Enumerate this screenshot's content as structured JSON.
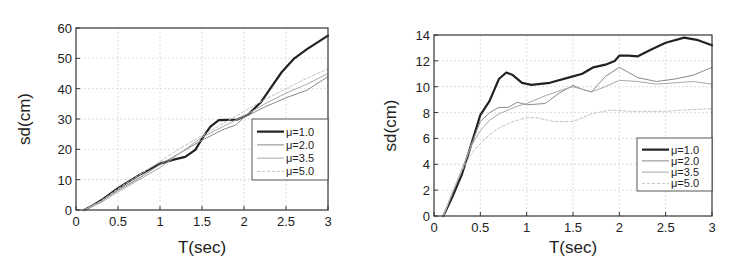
{
  "chart_data": [
    {
      "type": "line",
      "title": "",
      "xlabel": "T(sec)",
      "ylabel": "sd(cm)",
      "xlim": [
        0,
        3
      ],
      "ylim": [
        0,
        60
      ],
      "xticks": [
        0,
        0.5,
        1,
        1.5,
        2,
        2.5,
        3
      ],
      "xtick_labels": [
        "0",
        "0.5",
        "1",
        "1.5",
        "2",
        "2.5",
        "3"
      ],
      "yticks": [
        0,
        10,
        20,
        30,
        40,
        50,
        60
      ],
      "ytick_labels": [
        "0",
        "10",
        "20",
        "30",
        "40",
        "50",
        "60"
      ],
      "grid": true,
      "legend_position": "lower right (inside)",
      "series": [
        {
          "name": "μ=1.0",
          "color": "#222222",
          "width": 2.2,
          "dash": "",
          "x": [
            0.1,
            0.2,
            0.3,
            0.5,
            0.75,
            1.0,
            1.15,
            1.3,
            1.42,
            1.5,
            1.6,
            1.7,
            1.8,
            1.92,
            2.05,
            2.2,
            2.3,
            2.45,
            2.6,
            2.75,
            3.0
          ],
          "y": [
            0,
            1.5,
            3.2,
            7.2,
            11.5,
            15.3,
            16.5,
            17.5,
            19.8,
            23.5,
            27.5,
            29.6,
            29.7,
            29.8,
            31.5,
            35.5,
            39.5,
            45.5,
            50,
            53,
            57.5
          ]
        },
        {
          "name": "μ=2.0",
          "color": "#8a8a8a",
          "width": 1.0,
          "dash": "",
          "x": [
            0.1,
            0.3,
            0.5,
            0.75,
            1.0,
            1.25,
            1.5,
            1.75,
            1.9,
            2.0,
            2.25,
            2.5,
            2.75,
            3.0
          ],
          "y": [
            0,
            3,
            6.5,
            10.5,
            15,
            19,
            23,
            26.5,
            28,
            30.5,
            34,
            37,
            39.5,
            44
          ]
        },
        {
          "name": "μ=3.5",
          "color": "#a8a8a8",
          "width": 1.0,
          "dash": "",
          "x": [
            0.1,
            0.3,
            0.5,
            0.75,
            1.0,
            1.25,
            1.5,
            1.75,
            2.0,
            2.25,
            2.5,
            2.75,
            3.0
          ],
          "y": [
            0,
            2.5,
            6,
            10,
            14,
            19,
            24,
            27.5,
            31,
            35,
            38.5,
            41.5,
            45
          ]
        },
        {
          "name": "μ=5.0",
          "color": "#c4c4c4",
          "width": 1.0,
          "dash": "3,2",
          "x": [
            0.1,
            0.3,
            0.5,
            0.75,
            1.0,
            1.25,
            1.5,
            1.75,
            2.0,
            2.25,
            2.5,
            2.75,
            3.0
          ],
          "y": [
            0,
            3,
            7,
            11.5,
            16,
            20.5,
            24.5,
            28.5,
            32.5,
            36.5,
            40,
            43.5,
            46.5
          ]
        }
      ]
    },
    {
      "type": "line",
      "title": "",
      "xlabel": "T(sec)",
      "ylabel": "sd(cm)",
      "xlim": [
        0,
        3
      ],
      "ylim": [
        0,
        14
      ],
      "xticks": [
        0,
        0.5,
        1,
        1.5,
        2,
        2.5,
        3
      ],
      "xtick_labels": [
        "0",
        "0.5",
        "1",
        "1.5",
        "2",
        "2.5",
        "3"
      ],
      "yticks": [
        0,
        2,
        4,
        6,
        8,
        10,
        12,
        14
      ],
      "ytick_labels": [
        "0",
        "2",
        "4",
        "6",
        "8",
        "10",
        "12",
        "14"
      ],
      "grid": true,
      "legend_position": "lower right (inside)",
      "series": [
        {
          "name": "μ=1.0",
          "color": "#222222",
          "width": 2.2,
          "dash": "",
          "x": [
            0.1,
            0.2,
            0.3,
            0.4,
            0.5,
            0.6,
            0.7,
            0.78,
            0.85,
            0.95,
            1.05,
            1.25,
            1.5,
            1.6,
            1.72,
            1.85,
            1.95,
            2.0,
            2.1,
            2.2,
            2.35,
            2.5,
            2.7,
            2.85,
            3.0
          ],
          "y": [
            0,
            1.5,
            3.2,
            5.5,
            7.8,
            8.9,
            10.6,
            11.1,
            10.9,
            10.3,
            10.15,
            10.3,
            10.8,
            11.0,
            11.5,
            11.7,
            12.0,
            12.4,
            12.4,
            12.35,
            12.9,
            13.4,
            13.8,
            13.6,
            13.2
          ]
        },
        {
          "name": "μ=2.0",
          "color": "#8a8a8a",
          "width": 1.0,
          "dash": "",
          "x": [
            0.1,
            0.2,
            0.3,
            0.4,
            0.5,
            0.6,
            0.7,
            0.8,
            0.9,
            1.0,
            1.2,
            1.35,
            1.5,
            1.6,
            1.7,
            1.85,
            2.0,
            2.2,
            2.4,
            2.6,
            2.8,
            3.0
          ],
          "y": [
            0,
            1.8,
            3.5,
            5.5,
            7.3,
            8.0,
            8.4,
            8.4,
            8.8,
            8.6,
            8.7,
            9.5,
            10.1,
            9.8,
            9.6,
            10.8,
            11.5,
            10.7,
            10.4,
            10.6,
            10.9,
            11.5
          ]
        },
        {
          "name": "μ=3.5",
          "color": "#a8a8a8",
          "width": 1.0,
          "dash": "",
          "x": [
            0.1,
            0.2,
            0.3,
            0.4,
            0.5,
            0.6,
            0.7,
            0.8,
            0.9,
            1.0,
            1.2,
            1.4,
            1.5,
            1.6,
            1.7,
            1.85,
            2.0,
            2.2,
            2.4,
            2.6,
            2.8,
            3.0
          ],
          "y": [
            0,
            1.8,
            3.6,
            5.4,
            6.6,
            7.4,
            7.9,
            8.2,
            8.5,
            8.7,
            9.3,
            9.8,
            10.0,
            9.8,
            9.6,
            10.0,
            10.5,
            10.4,
            10.2,
            10.3,
            10.4,
            10.2
          ]
        },
        {
          "name": "μ=5.0",
          "color": "#c4c4c4",
          "width": 1.0,
          "dash": "3,2",
          "x": [
            0.1,
            0.2,
            0.3,
            0.4,
            0.5,
            0.6,
            0.7,
            0.85,
            1.0,
            1.1,
            1.3,
            1.5,
            1.7,
            1.9,
            2.1,
            2.3,
            2.5,
            2.7,
            3.0
          ],
          "y": [
            0,
            1.9,
            3.5,
            4.8,
            5.6,
            6.3,
            6.8,
            7.3,
            7.6,
            7.6,
            7.3,
            7.3,
            7.9,
            8.2,
            8.1,
            8.1,
            8.1,
            8.2,
            8.3
          ]
        }
      ]
    }
  ]
}
